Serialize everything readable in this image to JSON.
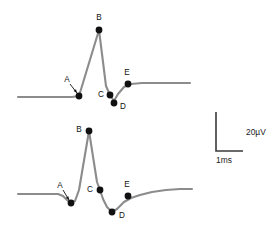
{
  "figure": {
    "width": 279,
    "height": 243,
    "background": "#ffffff",
    "trace_color": "#8c8c8c",
    "marker_color": "#111111",
    "axis_color": "#3a3a3a"
  },
  "scalebar": {
    "name": "calibration-scale-bar",
    "vertical_label": "20µV",
    "horizontal_label": "1ms",
    "corner_x": 216,
    "corner_y": 151,
    "vertical_top_y": 112,
    "horizontal_right_x": 243,
    "vertical_label_x": 246,
    "vertical_label_y": 133,
    "horizontal_label_x": 216,
    "horizontal_label_y": 161
  },
  "chart_data": {
    "type": "line",
    "title": "",
    "xlabel": "1ms",
    "ylabel": "20µV",
    "grid": false,
    "legend": "none",
    "scale_vertical": "20µV",
    "scale_horizontal": "1ms",
    "series": [
      {
        "name": "waveform-top",
        "baseline_y": 97,
        "path": "M 18,97 L 66,97 L 72,97 L 79,96 L 99,30 L 106,86 L 110,95 L 114,101 L 118,94 L 124,87 L 131,84 L 142,83 L 160,83 L 190,83",
        "points": [
          {
            "label": "A",
            "x": 79,
            "y": 96,
            "label_x": 67,
            "label_y": 80,
            "pointer": true,
            "pointer_from_x": 70,
            "pointer_from_y": 84,
            "pointer_to_x": 77,
            "pointer_to_y": 93
          },
          {
            "label": "B",
            "x": 99,
            "y": 30,
            "label_x": 99,
            "label_y": 18,
            "pointer": false
          },
          {
            "label": "C",
            "x": 110,
            "y": 95,
            "label_x": 101,
            "label_y": 95,
            "pointer": false
          },
          {
            "label": "D",
            "x": 114,
            "y": 103,
            "label_x": 123,
            "label_y": 107,
            "pointer": false
          },
          {
            "label": "E",
            "x": 128,
            "y": 84,
            "label_x": 127,
            "label_y": 73,
            "pointer": false
          }
        ]
      },
      {
        "name": "waveform-bottom",
        "baseline_y": 194,
        "path": "M 18,194 L 52,194 L 58,194 L 63,196 L 67,200 L 71,203 L 75,201 L 79,190 L 89,131 L 97,182 L 100,190 L 103,199 L 107,207 L 112,212 L 117,209 L 124,202 L 131,198 L 140,195 L 152,192 L 166,190 L 180,189 L 192,189",
        "points": [
          {
            "label": "A",
            "x": 71,
            "y": 203,
            "label_x": 60,
            "label_y": 186,
            "pointer": true,
            "pointer_from_x": 63,
            "pointer_from_y": 190,
            "pointer_to_x": 69,
            "pointer_to_y": 200
          },
          {
            "label": "B",
            "x": 89,
            "y": 131,
            "label_x": 79,
            "label_y": 130,
            "pointer": false
          },
          {
            "label": "C",
            "x": 100,
            "y": 190,
            "label_x": 90,
            "label_y": 190,
            "pointer": false
          },
          {
            "label": "D",
            "x": 112,
            "y": 212,
            "label_x": 122,
            "label_y": 216,
            "pointer": false
          },
          {
            "label": "E",
            "x": 128,
            "y": 196,
            "label_x": 127,
            "label_y": 185,
            "pointer": false
          }
        ]
      }
    ]
  }
}
